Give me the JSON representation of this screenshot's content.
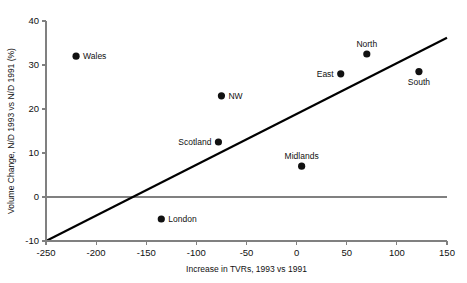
{
  "chart_data": {
    "type": "scatter",
    "title": "",
    "xlabel": "Increase in TVRs, 1993 vs 1991",
    "ylabel": "Volume Change, N/D 1993 vs N/D 1991 (%)",
    "xlim": [
      -250,
      150
    ],
    "ylim": [
      -10,
      40
    ],
    "xticks": [
      -250,
      -200,
      -150,
      -100,
      -50,
      0,
      50,
      100,
      150
    ],
    "xtick_labels": [
      "-250",
      "-200",
      "-150",
      "-100",
      "-50",
      "0",
      "50",
      "100",
      "150"
    ],
    "yticks": [
      -10,
      0,
      10,
      20,
      30,
      40
    ],
    "ytick_labels": [
      "-10",
      "0",
      "10",
      "20",
      "30",
      "40"
    ],
    "grid": false,
    "legend": "none",
    "zero_line_y": 0,
    "points": [
      {
        "label": "Wales",
        "x": -220,
        "y": 32.0,
        "label_pos": "right"
      },
      {
        "label": "London",
        "x": -135,
        "y": -5.0,
        "label_pos": "right"
      },
      {
        "label": "Scotland",
        "x": -78,
        "y": 12.5,
        "label_pos": "left"
      },
      {
        "label": "NW",
        "x": -75,
        "y": 23.0,
        "label_pos": "right"
      },
      {
        "label": "Midlands",
        "x": 5,
        "y": 7.0,
        "label_pos": "above"
      },
      {
        "label": "East",
        "x": 44,
        "y": 28.0,
        "label_pos": "left"
      },
      {
        "label": "North",
        "x": 70,
        "y": 32.5,
        "label_pos": "above"
      },
      {
        "label": "South",
        "x": 122,
        "y": 28.5,
        "label_pos": "below"
      }
    ],
    "fit_line": {
      "x0": -250,
      "y0": -10,
      "x1": 150,
      "y1": 36.2
    },
    "colors": {
      "point": "#111111",
      "fit_line": "#000000",
      "axis": "#808080",
      "text": "#111111",
      "background": "#ffffff"
    }
  }
}
